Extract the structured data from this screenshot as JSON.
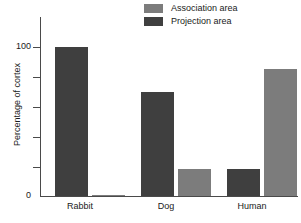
{
  "chart_data": {
    "type": "bar",
    "title": "",
    "subtitle": "",
    "xlabel": "",
    "ylabel": "Percentage of cortex",
    "categories": [
      "Rabbit",
      "Dog",
      "Human"
    ],
    "series": [
      {
        "name": "Association area",
        "color": "#7c7c7c",
        "values": [
          1,
          18,
          85
        ]
      },
      {
        "name": "Projection area",
        "color": "#3f3f3f",
        "values": [
          100,
          70,
          18
        ]
      }
    ],
    "series_order_per_category": [
      [
        "Projection area",
        "Association area"
      ],
      [
        "Projection area",
        "Association area"
      ],
      [
        "Projection area",
        "Association area"
      ]
    ],
    "ylim": [
      0,
      120
    ],
    "ytick_values": [
      0,
      100
    ],
    "ytick_labels": [
      "0",
      "100"
    ],
    "minor_tick_values": [
      20,
      40,
      60,
      80,
      100
    ],
    "grid": false,
    "legend_position": "top-right",
    "axis_color": "#4a4a4a"
  },
  "legend": {
    "entries": [
      {
        "label": "Association area",
        "swatch_name": "legend-swatch-association"
      },
      {
        "label": "Projection area",
        "swatch_name": "legend-swatch-projection"
      }
    ]
  },
  "axis": {
    "y_title": "Percentage of cortex",
    "y_top_label": "100",
    "y_zero_label": "0"
  },
  "categories": {
    "rabbit": "Rabbit",
    "dog": "Dog",
    "human": "Human"
  }
}
